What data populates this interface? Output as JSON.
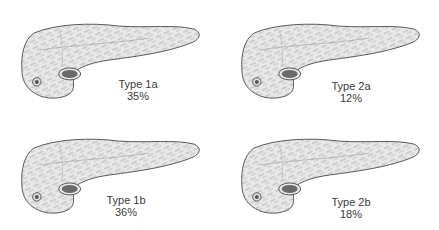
{
  "diagram": {
    "colors": {
      "organ_fill": "#e8e8e8",
      "outline": "#555555",
      "hatch": "#8a8a8a",
      "duct": "#555555",
      "text": "#3a3a3a"
    },
    "panels": [
      {
        "id": "type-1a",
        "type": "Type 1a",
        "percent": "35%"
      },
      {
        "id": "type-2a",
        "type": "Type 2a",
        "percent": "12%"
      },
      {
        "id": "type-1b",
        "type": "Type 1b",
        "percent": "36%"
      },
      {
        "id": "type-2b",
        "type": "Type 2b",
        "percent": "18%"
      }
    ]
  }
}
